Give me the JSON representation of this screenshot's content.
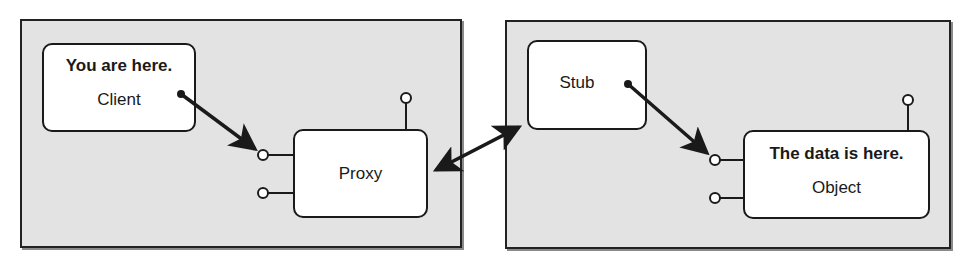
{
  "diagram": {
    "left_panel": {
      "client": {
        "callout": "You are here.",
        "label": "Client"
      },
      "proxy": {
        "label": "Proxy"
      }
    },
    "right_panel": {
      "stub": {
        "label": "Stub"
      },
      "object": {
        "callout": "The data is here.",
        "label": "Object"
      }
    },
    "colors": {
      "panel_fill": "#e3e3e3",
      "box_fill": "#ffffff",
      "stroke": "#1a1a1a"
    }
  }
}
